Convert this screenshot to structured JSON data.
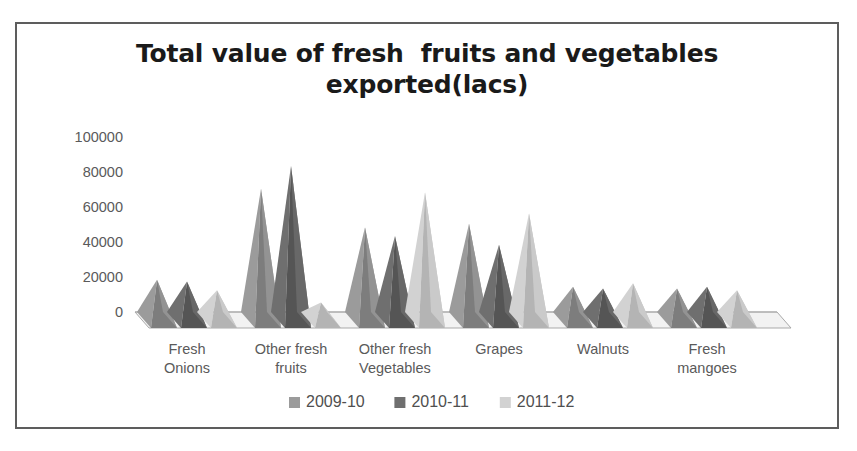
{
  "chart_data": {
    "type": "bar",
    "title_line1": "Total value of fresh  fruits and vegetables",
    "title_line2": "exported(lacs)",
    "xlabel": "",
    "ylabel": "",
    "ylim": [
      0,
      100000
    ],
    "yticks": [
      0,
      20000,
      40000,
      60000,
      80000,
      100000
    ],
    "ytick_labels": [
      "0",
      "20000",
      "40000",
      "60000",
      "80000",
      "100000"
    ],
    "grid": false,
    "legend_position": "bottom",
    "style": "3d-cone",
    "categories": [
      "Fresh Onions",
      "Other fresh fruits",
      "Other fresh Vegetables",
      "Grapes",
      "Walnuts",
      "Fresh mangoes"
    ],
    "category_lines": [
      [
        "Fresh",
        "Onions"
      ],
      [
        "Other fresh",
        "fruits"
      ],
      [
        "Other fresh",
        "Vegetables"
      ],
      [
        "Grapes",
        ""
      ],
      [
        "Walnuts",
        ""
      ],
      [
        "Fresh",
        "mangoes"
      ]
    ],
    "series": [
      {
        "name": "2009-10",
        "color": "#9b9b9b",
        "color_dark": "#7d7d7d",
        "values": [
          23000,
          75000,
          53000,
          55000,
          19000,
          18000
        ]
      },
      {
        "name": "2010-11",
        "color": "#6f6f6f",
        "color_dark": "#555555",
        "values": [
          22000,
          88000,
          48000,
          43000,
          18000,
          19000
        ]
      },
      {
        "name": "2011-12",
        "color": "#d2d2d2",
        "color_dark": "#b4b4b4",
        "values": [
          17000,
          10000,
          73000,
          61000,
          21000,
          17000
        ]
      }
    ]
  },
  "legend": {
    "items": [
      {
        "label": "2009-10",
        "color": "#9b9b9b"
      },
      {
        "label": "2010-11",
        "color": "#6f6f6f"
      },
      {
        "label": "2011-12",
        "color": "#d2d2d2"
      }
    ]
  },
  "colors": {
    "frame_border": "#5d5d5d",
    "floor_fill": "#f2f2f2",
    "floor_edge": "#a9a9a9",
    "axis_text": "#5a5a5a",
    "title_text": "#1a1a1a",
    "background": "#ffffff"
  }
}
